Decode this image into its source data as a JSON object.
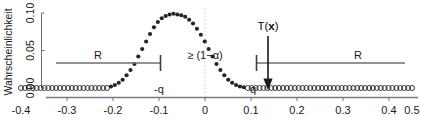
{
  "figure": {
    "background_color": "#ffffff",
    "axis_color": "#808080",
    "point_color": "#262626",
    "guide_color": "#cccccc",
    "annotation_color": "#1a1a1a"
  },
  "chart_data": {
    "type": "scatter",
    "title": "",
    "subtitle": "",
    "xlabel": "",
    "ylabel": "Wahrscheinlichkeit",
    "xlim": [
      -0.43,
      0.62
    ],
    "ylim": [
      0.0,
      0.108
    ],
    "grid": false,
    "legend": null,
    "xticks": [
      -0.4,
      -0.3,
      -0.2,
      -0.1,
      0,
      0.1,
      0.2,
      0.3,
      0.4,
      0.5,
      0.6
    ],
    "xticklabels": [
      "-0.4",
      "-0.3",
      "-0.2",
      "-0.1",
      "0",
      "0.1",
      "0.2",
      "0.3",
      "0.4",
      "0.5",
      "0.6"
    ],
    "yticks": [
      0.0,
      0.05,
      0.1
    ],
    "yticklabels": [
      "0.00",
      "0.05",
      "0.10"
    ],
    "series": [
      {
        "name": "acceptance-region-points",
        "marker": "filled-circle",
        "x": [
          -0.17,
          -0.16,
          -0.15,
          -0.14,
          -0.13,
          -0.12,
          -0.11,
          -0.1,
          -0.09,
          -0.08,
          -0.07,
          -0.06,
          -0.05,
          -0.04,
          -0.03,
          -0.02,
          -0.01,
          0.0,
          0.01,
          0.02,
          0.03,
          0.04,
          0.05,
          0.06,
          0.07,
          0.08,
          0.09,
          0.1,
          0.11,
          0.12,
          0.13,
          0.14,
          0.15,
          0.16,
          0.17
        ],
        "y": [
          0.002,
          0.004,
          0.007,
          0.011,
          0.017,
          0.024,
          0.032,
          0.042,
          0.052,
          0.062,
          0.072,
          0.081,
          0.088,
          0.093,
          0.096,
          0.098,
          0.099,
          0.098,
          0.097,
          0.095,
          0.091,
          0.086,
          0.079,
          0.071,
          0.062,
          0.052,
          0.042,
          0.032,
          0.024,
          0.017,
          0.011,
          0.007,
          0.004,
          0.002,
          0.001
        ]
      },
      {
        "name": "rejection-region-points-left",
        "marker": "open-circle",
        "x": [
          -0.4,
          -0.39,
          -0.38,
          -0.37,
          -0.36,
          -0.35,
          -0.34,
          -0.33,
          -0.32,
          -0.31,
          -0.3,
          -0.29,
          -0.28,
          -0.27,
          -0.26,
          -0.25,
          -0.24,
          -0.23,
          -0.22,
          -0.21,
          -0.2,
          -0.19,
          -0.18
        ],
        "y": [
          0,
          0,
          0,
          0,
          0,
          0,
          0,
          0,
          0,
          0,
          0,
          0,
          0,
          0,
          0,
          0,
          0,
          0,
          0,
          0,
          0,
          0,
          0
        ]
      },
      {
        "name": "rejection-region-points-right",
        "marker": "open-circle",
        "x": [
          0.18,
          0.19,
          0.2,
          0.21,
          0.22,
          0.23,
          0.24,
          0.25,
          0.26,
          0.27,
          0.28,
          0.29,
          0.3,
          0.31,
          0.32,
          0.33,
          0.34,
          0.35,
          0.36,
          0.37,
          0.38,
          0.39,
          0.4,
          0.41,
          0.42,
          0.43,
          0.44,
          0.45,
          0.46,
          0.47,
          0.48,
          0.49,
          0.5,
          0.51,
          0.52,
          0.53,
          0.54,
          0.55,
          0.56,
          0.57,
          0.58,
          0.59,
          0.6
        ],
        "y": [
          0,
          0,
          0,
          0,
          0,
          0,
          0,
          0,
          0,
          0,
          0,
          0,
          0,
          0,
          0,
          0,
          0,
          0,
          0,
          0,
          0,
          0,
          0,
          0,
          0,
          0,
          0,
          0,
          0,
          0,
          0,
          0,
          0,
          0,
          0,
          0,
          0,
          0,
          0,
          0,
          0,
          0,
          0
        ]
      }
    ],
    "annotations": [
      {
        "name": "confidence-annotation",
        "text": "≥ (1−α)",
        "x": 0.0,
        "y": 0.052
      },
      {
        "name": "left-region-label",
        "text": "R",
        "x": -0.27,
        "y": 0.056
      },
      {
        "name": "right-region-label",
        "text": "R",
        "x": 0.33,
        "y": 0.056
      },
      {
        "name": "left-quantile-label",
        "text": "-q",
        "x": -0.145,
        "y": 0.0
      },
      {
        "name": "right-quantile-label",
        "text": "q",
        "x": 0.152,
        "y": 0.0
      },
      {
        "name": "test-statistic-label",
        "text": "T(x)",
        "text_prefix": "T(",
        "text_variable": "x",
        "text_suffix": ")",
        "x": 0.175,
        "y": 0.098
      }
    ],
    "region_bars": [
      {
        "name": "left-rejection-bar",
        "x_start": -0.4,
        "x_end": -0.175,
        "y": 0.045,
        "end_cap": "right"
      },
      {
        "name": "right-rejection-bar",
        "x_start": 0.175,
        "x_end": 0.6,
        "y": 0.045,
        "end_cap": "left"
      }
    ],
    "reference_lines": [
      {
        "name": "zero-vertical-guide",
        "orientation": "vertical",
        "x": 0.0,
        "style": "dotted"
      }
    ],
    "arrows": [
      {
        "name": "test-statistic-arrow",
        "x": 0.175,
        "y_start": 0.085,
        "y_end": 0.008,
        "direction": "down"
      }
    ]
  }
}
